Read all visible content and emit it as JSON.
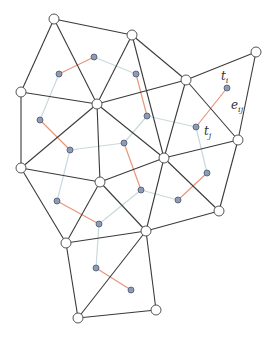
{
  "diagram": {
    "type": "triangle-mesh-with-dual-graph",
    "colors": {
      "mesh_edge": "#3a3a3a",
      "mesh_vertex_fill": "#ffffff",
      "mesh_vertex_stroke": "#555555",
      "dual_node_fill": "#8d9bb5",
      "dual_node_stroke": "#4a5670",
      "dual_edge_cut": "#e8967a",
      "dual_edge_kept": "#c9d9dd"
    },
    "mesh_vertices": [
      {
        "id": 0,
        "x": 54,
        "y": 19
      },
      {
        "id": 1,
        "x": 132,
        "y": 35
      },
      {
        "id": 2,
        "x": 256,
        "y": 52
      },
      {
        "id": 3,
        "x": 186,
        "y": 80
      },
      {
        "id": 4,
        "x": 21,
        "y": 92
      },
      {
        "id": 5,
        "x": 97,
        "y": 104
      },
      {
        "id": 6,
        "x": 238,
        "y": 140
      },
      {
        "id": 7,
        "x": 164,
        "y": 158
      },
      {
        "id": 8,
        "x": 21,
        "y": 168
      },
      {
        "id": 9,
        "x": 100,
        "y": 182
      },
      {
        "id": 10,
        "x": 219,
        "y": 211
      },
      {
        "id": 11,
        "x": 66,
        "y": 243
      },
      {
        "id": 12,
        "x": 146,
        "y": 231
      },
      {
        "id": 13,
        "x": 78,
        "y": 318
      },
      {
        "id": 14,
        "x": 156,
        "y": 310
      }
    ],
    "mesh_edges": [
      [
        0,
        1
      ],
      [
        1,
        3
      ],
      [
        3,
        2
      ],
      [
        2,
        6
      ],
      [
        6,
        10
      ],
      [
        10,
        12
      ],
      [
        12,
        14
      ],
      [
        14,
        13
      ],
      [
        13,
        11
      ],
      [
        11,
        8
      ],
      [
        8,
        4
      ],
      [
        4,
        0
      ],
      [
        0,
        5
      ],
      [
        1,
        5
      ],
      [
        4,
        5
      ],
      [
        3,
        5
      ],
      [
        5,
        8
      ],
      [
        5,
        9
      ],
      [
        5,
        7
      ],
      [
        3,
        7
      ],
      [
        3,
        6
      ],
      [
        7,
        6
      ],
      [
        7,
        10
      ],
      [
        7,
        9
      ],
      [
        7,
        12
      ],
      [
        8,
        9
      ],
      [
        9,
        11
      ],
      [
        9,
        12
      ],
      [
        11,
        12
      ],
      [
        12,
        13
      ],
      [
        1,
        7
      ]
    ],
    "dual_nodes": [
      {
        "id": "a",
        "x": 59,
        "y": 74
      },
      {
        "id": "b",
        "x": 94,
        "y": 57
      },
      {
        "id": "c",
        "x": 136,
        "y": 74
      },
      {
        "id": "d",
        "x": 147,
        "y": 116
      },
      {
        "id": "e",
        "x": 40,
        "y": 120
      },
      {
        "id": "f",
        "x": 70,
        "y": 150
      },
      {
        "id": "g",
        "x": 124,
        "y": 143
      },
      {
        "id": "tj",
        "x": 196,
        "y": 127
      },
      {
        "id": "ti",
        "x": 227,
        "y": 88
      },
      {
        "id": "h",
        "x": 207,
        "y": 173
      },
      {
        "id": "i",
        "x": 141,
        "y": 190
      },
      {
        "id": "j",
        "x": 178,
        "y": 200
      },
      {
        "id": "k",
        "x": 57,
        "y": 201
      },
      {
        "id": "l",
        "x": 99,
        "y": 224
      },
      {
        "id": "m",
        "x": 96,
        "y": 268
      },
      {
        "id": "n",
        "x": 131,
        "y": 290
      }
    ],
    "dual_edges": [
      {
        "from": "a",
        "to": "b",
        "kind": "cut"
      },
      {
        "from": "b",
        "to": "c",
        "kind": "kept"
      },
      {
        "from": "c",
        "to": "d",
        "kind": "cut"
      },
      {
        "from": "a",
        "to": "e",
        "kind": "kept"
      },
      {
        "from": "e",
        "to": "f",
        "kind": "cut"
      },
      {
        "from": "f",
        "to": "g",
        "kind": "kept"
      },
      {
        "from": "d",
        "to": "tj",
        "kind": "kept"
      },
      {
        "from": "tj",
        "to": "ti",
        "kind": "cut"
      },
      {
        "from": "tj",
        "to": "h",
        "kind": "kept"
      },
      {
        "from": "h",
        "to": "j",
        "kind": "cut"
      },
      {
        "from": "j",
        "to": "i",
        "kind": "kept"
      },
      {
        "from": "i",
        "to": "g",
        "kind": "cut"
      },
      {
        "from": "d",
        "to": "g",
        "kind": "kept"
      },
      {
        "from": "f",
        "to": "k",
        "kind": "kept"
      },
      {
        "from": "k",
        "to": "l",
        "kind": "cut"
      },
      {
        "from": "l",
        "to": "i",
        "kind": "kept"
      },
      {
        "from": "l",
        "to": "m",
        "kind": "kept"
      },
      {
        "from": "m",
        "to": "n",
        "kind": "cut"
      }
    ],
    "labels": {
      "t_i": {
        "base": "t",
        "sub": "i",
        "x": 221,
        "y": 70
      },
      "e_ij": {
        "base": "e",
        "sub": "ij",
        "x": 231,
        "y": 99
      },
      "t_j": {
        "base": "t",
        "sub": "j",
        "x": 204,
        "y": 125
      }
    }
  }
}
